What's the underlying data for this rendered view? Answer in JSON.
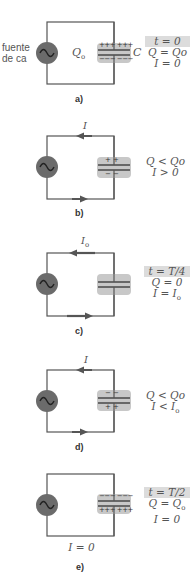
{
  "colors": {
    "wire": "#555555",
    "source_fill": "#6b6b6b",
    "cap_bg": "#c8c8c8",
    "highlight": "#dcdcdc"
  },
  "source_label": [
    "fuente",
    "de ca"
  ],
  "panels": [
    {
      "id": "a",
      "label": "a)",
      "center_label": "Qo",
      "cap_label": "C",
      "top_sign": "+++ +++",
      "bottom_sign": "−−− −−−",
      "eq": [
        "t = 0",
        "Q = Qo",
        "I = 0"
      ],
      "highlight_first": true,
      "arrow": "none"
    },
    {
      "id": "b",
      "label": "b)",
      "current_label": "I",
      "top_sign": "+ +",
      "bottom_sign": "− −",
      "eq": [
        "Q < Qo",
        "I > 0"
      ],
      "highlight_first": false,
      "arrow": "ccw"
    },
    {
      "id": "c",
      "label": "c)",
      "current_label": "Io",
      "top_sign": "",
      "bottom_sign": "",
      "eq": [
        "t = T/4",
        "Q = 0",
        "I = Io"
      ],
      "highlight_first": true,
      "arrow": "ccw-long"
    },
    {
      "id": "d",
      "label": "d)",
      "current_label": "I",
      "top_sign": "− −",
      "bottom_sign": "+ +",
      "eq": [
        "Q < Qo",
        "I < Io"
      ],
      "highlight_first": false,
      "arrow": "ccw"
    },
    {
      "id": "e",
      "label": "e)",
      "bottom_label": "I = 0",
      "top_sign": "−−− −−−",
      "bottom_sign": "+++ +++",
      "eq": [
        "t = T/2",
        "Q = Qo",
        "I = 0"
      ],
      "highlight_first": true,
      "arrow": "none"
    }
  ]
}
